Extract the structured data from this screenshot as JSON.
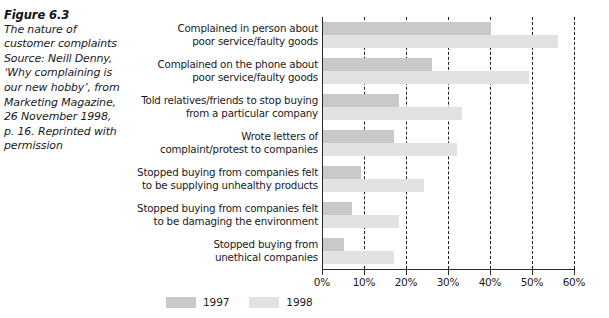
{
  "figure": {
    "label": "Figure 6.3",
    "caption_lines": [
      "The nature of",
      "customer complaints",
      "Source: Neill Denny,",
      "‘Why complaining is",
      "our new hobby’, from",
      "Marketing Magazine,",
      "26 November 1998,",
      "p. 16. Reprinted with",
      "permission"
    ]
  },
  "chart_data": {
    "type": "bar",
    "orientation": "horizontal",
    "title": "The nature of customer complaints",
    "xlabel": "",
    "ylabel": "",
    "xlim": [
      0,
      60
    ],
    "grid": true,
    "grid_axis": "x",
    "legend_position": "bottom",
    "tick_labels": [
      "0%",
      "10%",
      "20%",
      "30%",
      "40%",
      "50%",
      "60%"
    ],
    "tick_values": [
      0,
      10,
      20,
      30,
      40,
      50,
      60
    ],
    "categories": [
      "Complained in person about poor service/faulty goods",
      "Complained on the phone about poor service/faulty goods",
      "Told relatives/friends to stop buying from a particular company",
      "Wrote letters of complaint/protest to companies",
      "Stopped buying from companies felt to be supplying unhealthy products",
      "Stopped buying from companies felt to be damaging the environment",
      "Stopped buying from unethical companies"
    ],
    "category_lines": [
      [
        "Complained in person about",
        "poor service/faulty goods"
      ],
      [
        "Complained on the phone about",
        "poor service/faulty goods"
      ],
      [
        "Told relatives/friends to stop buying",
        "from a particular company"
      ],
      [
        "Wrote letters of",
        "complaint/protest to companies"
      ],
      [
        "Stopped buying from companies felt",
        "to be supplying unhealthy products"
      ],
      [
        "Stopped buying from companies felt",
        "to be damaging the environment"
      ],
      [
        "Stopped buying from",
        "unethical companies"
      ]
    ],
    "series": [
      {
        "name": "1997",
        "color": "#c9c9c9",
        "values": [
          40,
          26,
          18,
          17,
          9,
          7,
          5
        ]
      },
      {
        "name": "1998",
        "color": "#e2e2e2",
        "values": [
          56,
          49,
          33,
          32,
          24,
          18,
          17
        ]
      }
    ]
  },
  "legend": {
    "items": [
      {
        "label": "1997",
        "color": "#c9c9c9"
      },
      {
        "label": "1998",
        "color": "#e2e2e2"
      }
    ]
  }
}
